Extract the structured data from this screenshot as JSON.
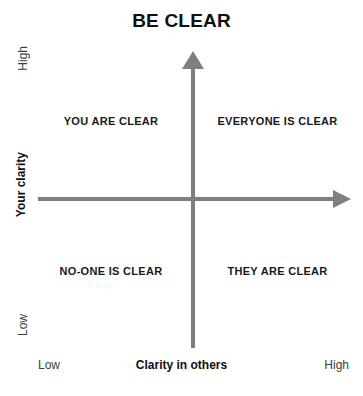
{
  "chart_data": {
    "type": "scatter",
    "title": "BE CLEAR",
    "xlabel": "Clarity in others",
    "ylabel": "Your clarity",
    "x_ticks": [
      "Low",
      "High"
    ],
    "y_ticks": [
      "Low",
      "High"
    ],
    "grid": false,
    "legend": null,
    "quadrants": [
      {
        "position": "top-left",
        "label": "YOU ARE CLEAR",
        "x": "low",
        "y": "high"
      },
      {
        "position": "top-right",
        "label": "EVERYONE IS CLEAR",
        "x": "high",
        "y": "high"
      },
      {
        "position": "bottom-left",
        "label": "NO-ONE IS CLEAR",
        "x": "low",
        "y": "low"
      },
      {
        "position": "bottom-right",
        "label": "THEY ARE CLEAR",
        "x": "high",
        "y": "low"
      }
    ],
    "axis_color": "#7f7f7f",
    "text_color": "#1a1a1a",
    "background_color": "#ffffff"
  },
  "title": "BE CLEAR",
  "axes": {
    "y_title": "Your clarity",
    "y_high": "High",
    "y_low": "Low",
    "x_title": "Clarity in others",
    "x_low": "Low",
    "x_high": "High"
  },
  "quadrants": {
    "top_left": "YOU ARE CLEAR",
    "top_right": "EVERYONE IS CLEAR",
    "bottom_left": "NO-ONE IS CLEAR",
    "bottom_right": "THEY ARE CLEAR"
  }
}
